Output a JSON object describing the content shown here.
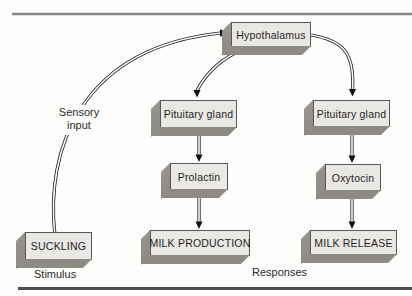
{
  "nodes": [
    {
      "id": "hypothalamus",
      "label": "Hypothalamus"
    },
    {
      "id": "pituitary-left",
      "label": "Pituitary gland"
    },
    {
      "id": "pituitary-right",
      "label": "Pituitary gland"
    },
    {
      "id": "prolactin",
      "label": "Prolactin"
    },
    {
      "id": "oxytocin",
      "label": "Oxytocin"
    },
    {
      "id": "suckling",
      "label": "SUCKLING"
    },
    {
      "id": "milk-production",
      "label": "MILK PRODUCTION"
    },
    {
      "id": "milk-release",
      "label": "MILK RELEASE"
    }
  ],
  "labels": {
    "sensory_input_line1": "Sensory",
    "sensory_input_line2": "input",
    "stimulus": "Stimulus",
    "responses": "Responses"
  },
  "edges": [
    {
      "from": "suckling",
      "to": "hypothalamus",
      "label": "Sensory input"
    },
    {
      "from": "hypothalamus",
      "to": "pituitary-left"
    },
    {
      "from": "hypothalamus",
      "to": "pituitary-right"
    },
    {
      "from": "pituitary-left",
      "to": "prolactin"
    },
    {
      "from": "prolactin",
      "to": "milk-production"
    },
    {
      "from": "pituitary-right",
      "to": "oxytocin"
    },
    {
      "from": "oxytocin",
      "to": "milk-release"
    }
  ],
  "colors": {
    "page_bg": "#fdfdfc",
    "box_face": "#e9e8e5",
    "box_border": "#56565b",
    "box_side": "#97948e",
    "box_bottom": "#8e8b85",
    "line": "#1c1c1c",
    "rule_top": "#868686",
    "rule_bottom": "#4e4e4e",
    "text": "#1f1f1f"
  }
}
